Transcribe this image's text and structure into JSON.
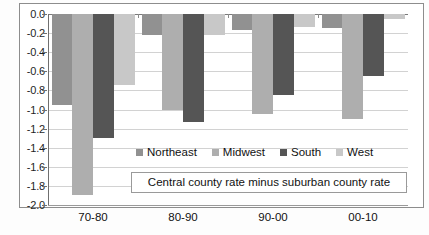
{
  "chart_data": {
    "type": "bar",
    "title": "",
    "subtitle": "",
    "annotation": "Central county rate minus suburban county rate",
    "xlabel": "",
    "ylabel": "",
    "categories": [
      "70-80",
      "80-90",
      "90-00",
      "00-10"
    ],
    "series": [
      {
        "name": "Northeast",
        "color": "#919191",
        "values": [
          -0.95,
          -0.22,
          -0.17,
          -0.15
        ]
      },
      {
        "name": "Midwest",
        "color": "#aeaeae",
        "values": [
          -1.9,
          -1.0,
          -1.05,
          -1.1
        ]
      },
      {
        "name": "South",
        "color": "#555555",
        "values": [
          -1.3,
          -1.13,
          -0.85,
          -0.65
        ]
      },
      {
        "name": "West",
        "color": "#c8c8c8",
        "values": [
          -0.74,
          -0.22,
          -0.14,
          -0.05
        ]
      }
    ],
    "ylim": [
      -2.0,
      0.0
    ],
    "ytick_step": 0.2,
    "ytick_labels": [
      "0.0",
      "-0.2",
      "-0.4",
      "-0.6",
      "-0.8",
      "-1.0",
      "-1.2",
      "-1.4",
      "-1.6",
      "-1.8",
      "-2.0"
    ],
    "ytick_values": [
      0.0,
      -0.2,
      -0.4,
      -0.6,
      -0.8,
      -1.0,
      -1.2,
      -1.4,
      -1.6,
      -1.8,
      -2.0
    ],
    "grid": true,
    "legend_position": "inside-bottom-center",
    "orientation": "vertical",
    "bar_direction": "downward"
  }
}
